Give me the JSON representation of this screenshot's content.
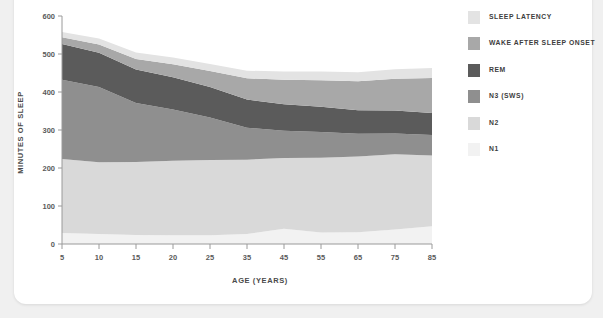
{
  "chart_data": {
    "type": "area",
    "title": "",
    "subtitle": "",
    "xlabel": "AGE (YEARS)",
    "ylabel": "MINUTES OF SLEEP",
    "stacked": true,
    "grid": false,
    "legend_position": "right",
    "xlim": [
      5,
      85
    ],
    "ylim": [
      0,
      600
    ],
    "x_ticks": [
      5,
      10,
      15,
      20,
      25,
      35,
      45,
      55,
      65,
      75,
      85
    ],
    "x_tick_labels": [
      "5",
      "10",
      "15",
      "20",
      "25",
      "35",
      "45",
      "55",
      "65",
      "75",
      "85"
    ],
    "y_ticks": [
      0,
      100,
      200,
      300,
      400,
      500,
      600
    ],
    "y_tick_labels": [
      "0",
      "100",
      "200",
      "300",
      "400",
      "500",
      "600"
    ],
    "x": [
      5,
      10,
      15,
      20,
      25,
      35,
      45,
      55,
      65,
      75,
      85
    ],
    "series": [
      {
        "name": "N1",
        "color": "#f2f2f2",
        "values": [
          29,
          26,
          24,
          23,
          23,
          26,
          40,
          30,
          31,
          38,
          47
        ]
      },
      {
        "name": "N2",
        "color": "#d9d9d9",
        "values": [
          195,
          189,
          192,
          196,
          198,
          196,
          186,
          197,
          199,
          198,
          186
        ]
      },
      {
        "name": "N3 (SWS)",
        "color": "#8f8f8f",
        "values": [
          208,
          198,
          155,
          135,
          112,
          84,
          72,
          68,
          60,
          55,
          54
        ]
      },
      {
        "name": "REM",
        "color": "#5b5b5b",
        "values": [
          94,
          90,
          88,
          85,
          80,
          74,
          70,
          66,
          62,
          60,
          58
        ]
      },
      {
        "name": "WAKE AFTER SLEEP ONSET",
        "color": "#a8a8a8",
        "values": [
          18,
          22,
          28,
          34,
          42,
          56,
          64,
          70,
          76,
          84,
          92
        ]
      },
      {
        "name": "SLEEP LATENCY",
        "color": "#e3e3e3",
        "values": [
          14,
          16,
          17,
          18,
          19,
          20,
          22,
          23,
          24,
          25,
          26
        ]
      }
    ],
    "legend": [
      {
        "label": "SLEEP LATENCY",
        "color": "#e3e3e3"
      },
      {
        "label": "WAKE AFTER SLEEP ONSET",
        "color": "#a8a8a8"
      },
      {
        "label": "REM",
        "color": "#5b5b5b"
      },
      {
        "label": "N3 (SWS)",
        "color": "#8f8f8f"
      },
      {
        "label": "N2",
        "color": "#d9d9d9"
      },
      {
        "label": "N1",
        "color": "#f2f2f2"
      }
    ],
    "axis_color": "#9a9a9a"
  }
}
